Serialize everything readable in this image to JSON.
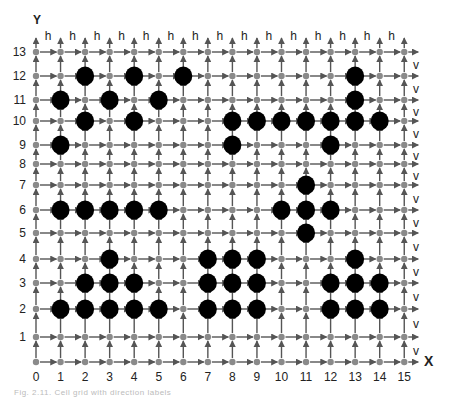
{
  "figure": {
    "axis_x_label": "X",
    "axis_y_label": "Y",
    "x_ticks": [
      "0",
      "1",
      "2",
      "3",
      "4",
      "5",
      "6",
      "7",
      "8",
      "9",
      "10",
      "11",
      "12",
      "13",
      "14",
      "15"
    ],
    "y_ticks": [
      "0",
      "1",
      "2",
      "3",
      "4",
      "5",
      "6",
      "7",
      "8",
      "9",
      "10",
      "11",
      "12",
      "13"
    ],
    "top_edge_label": "h",
    "right_edge_label": "v",
    "node_color": "#8a8a8a",
    "arrow_color": "#555555",
    "obstacle_color": "#000000",
    "caption": "Fig. 2.11. Cell grid with direction labels"
  },
  "chart_data": {
    "type": "scatter",
    "title": "",
    "xlabel": "X",
    "ylabel": "Y",
    "xlim": [
      0,
      15
    ],
    "ylim": [
      0,
      13
    ],
    "grid": true,
    "top_labels": "h (between each column pair, row 13)",
    "right_labels": "v (between each row pair, column 15)",
    "obstacles": [
      [
        1,
        11
      ],
      [
        2,
        12
      ],
      [
        2,
        10
      ],
      [
        3,
        11
      ],
      [
        4,
        12
      ],
      [
        4,
        10
      ],
      [
        5,
        11
      ],
      [
        6,
        12
      ],
      [
        1,
        9
      ],
      [
        8,
        10
      ],
      [
        9,
        10
      ],
      [
        10,
        10
      ],
      [
        11,
        10
      ],
      [
        12,
        10
      ],
      [
        13,
        10
      ],
      [
        14,
        10
      ],
      [
        13,
        11
      ],
      [
        13,
        12
      ],
      [
        8,
        9
      ],
      [
        12,
        9
      ],
      [
        1,
        6
      ],
      [
        2,
        6
      ],
      [
        3,
        6
      ],
      [
        4,
        6
      ],
      [
        5,
        6
      ],
      [
        11,
        7
      ],
      [
        10,
        6
      ],
      [
        11,
        6
      ],
      [
        12,
        6
      ],
      [
        11,
        5
      ],
      [
        3,
        4
      ],
      [
        2,
        3
      ],
      [
        3,
        3
      ],
      [
        4,
        3
      ],
      [
        1,
        2
      ],
      [
        2,
        2
      ],
      [
        3,
        2
      ],
      [
        4,
        2
      ],
      [
        5,
        2
      ],
      [
        7,
        4
      ],
      [
        8,
        4
      ],
      [
        9,
        4
      ],
      [
        7,
        3
      ],
      [
        8,
        3
      ],
      [
        9,
        3
      ],
      [
        7,
        2
      ],
      [
        8,
        2
      ],
      [
        9,
        2
      ],
      [
        13,
        4
      ],
      [
        12,
        3
      ],
      [
        13,
        3
      ],
      [
        14,
        3
      ],
      [
        12,
        2
      ],
      [
        13,
        2
      ],
      [
        14,
        2
      ]
    ]
  }
}
